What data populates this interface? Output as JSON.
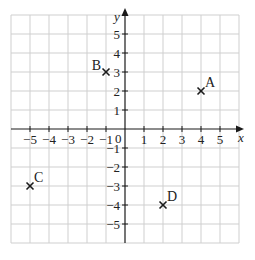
{
  "diagram": {
    "type": "coordinate-grid",
    "x_axis_label": "x",
    "y_axis_label": "y",
    "origin_label": "0",
    "x_range": [
      -6,
      6
    ],
    "y_range": [
      -6,
      6
    ],
    "x_ticks": [
      "-5",
      "-4",
      "-3",
      "-2",
      "-1",
      "1",
      "2",
      "3",
      "4",
      "5"
    ],
    "y_ticks": [
      "5",
      "4",
      "3",
      "2",
      "1",
      "-1",
      "-2",
      "-3",
      "-4",
      "-5"
    ],
    "points": [
      {
        "label": "A",
        "x": 4,
        "y": 2
      },
      {
        "label": "B",
        "x": -1,
        "y": 3
      },
      {
        "label": "C",
        "x": -5,
        "y": -3
      },
      {
        "label": "D",
        "x": 2,
        "y": -4
      }
    ],
    "colors": {
      "grid": "#cfcfcf",
      "axis": "#1a1a1a",
      "text": "#222222"
    }
  }
}
